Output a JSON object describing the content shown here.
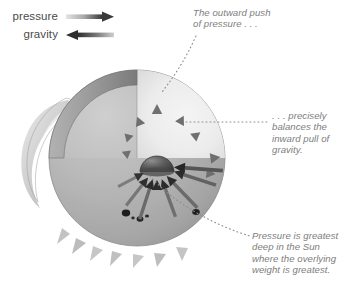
{
  "figure": {
    "background_color": "#ffffff"
  },
  "legend": {
    "items": [
      {
        "label": "pressure",
        "icon": "arrow-right-icon",
        "direction": "right",
        "color_start": "#d8d8d8",
        "color_end": "#3a3a3a"
      },
      {
        "label": "gravity",
        "icon": "arrow-left-icon",
        "direction": "left",
        "color_start": "#2e2e2e",
        "color_end": "#cfcfcf"
      }
    ]
  },
  "annotations": [
    {
      "id": "outward",
      "text": "The outward push\nof pressure . . .",
      "color": "#7d7d7d",
      "leader": "dotted-curve"
    },
    {
      "id": "balances",
      "text": ". . . precisely\nbalances the\ninward pull of\ngravity.",
      "color": "#7d7d7d",
      "leader": "dotted-horizontal"
    },
    {
      "id": "deepest",
      "text": "Pressure is greatest\ndeep in the Sun\nwhere the overlying\nweight is greatest.",
      "color": "#7d7d7d",
      "leader": "dotted-curve"
    }
  ],
  "diagram": {
    "sphere": {
      "center_x": 137,
      "center_y": 158,
      "radius": 88,
      "surface_color_light": "#bdbdbd",
      "surface_color_dark": "#8e8e8e"
    },
    "cutaway": {
      "interior_color": "#ececec",
      "wall_color": "#9a9a9a",
      "wall_shadow_color": "#7c7c7c"
    },
    "core": {
      "label": "core",
      "color_light": "#8a8a8a",
      "color_dark": "#3f3f3f",
      "center_x": 156,
      "center_y": 170,
      "radius": 16
    },
    "features": [
      {
        "name": "prominence-loop",
        "side": "left"
      },
      {
        "name": "sunspot-group",
        "side": "lower-left",
        "count": 4
      },
      {
        "name": "sunspot",
        "side": "lower-right",
        "count": 1
      },
      {
        "name": "spicules",
        "side": "bottom"
      }
    ],
    "arrows": {
      "pressure_color_start": "#e2e2e2",
      "pressure_color_end": "#6f6f6f",
      "gravity_color_start": "#2f2f2f",
      "gravity_color_end": "#9a9a9a",
      "pressure_count": 8,
      "gravity_count": 8,
      "description": "Paired arrows radiate outward from the core (pressure) and point inward toward the core (gravity)."
    }
  }
}
